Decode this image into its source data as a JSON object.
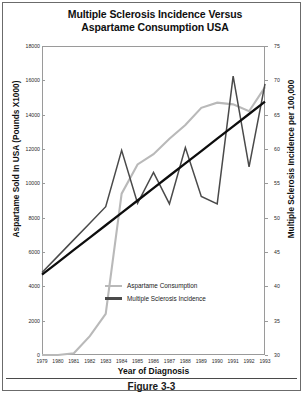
{
  "figure": {
    "title_line1": "Multiple Sclerosis Incidence Versus",
    "title_line2": "Aspartame Consumption USA",
    "caption": "Figure 3-3"
  },
  "legend": {
    "position": "inside-lower-center",
    "items": [
      {
        "label": "Aspartame Consumption",
        "color": "#b9b9b9"
      },
      {
        "label": "Multiple Sclerosis Incidence",
        "color": "#4a4a4a"
      }
    ]
  },
  "colors": {
    "aspartame": "#b9b9b9",
    "ms_incidence": "#4a4a4a",
    "trendline": "#0d0d0d",
    "frame": "#9a9a9a",
    "text": "#101010"
  },
  "chart_data": {
    "type": "line",
    "title": "Multiple Sclerosis Incidence Versus Aspartame Consumption USA",
    "xlabel": "Year of Diagnosis",
    "ylabel": "Aspartame Sold In USA (Pounds X1000)",
    "y2label": "Multiple Sclerosis Incidence per 100,000",
    "grid": false,
    "x": [
      1979,
      1980,
      1981,
      1982,
      1983,
      1984,
      1985,
      1986,
      1987,
      1988,
      1989,
      1990,
      1991,
      1992,
      1993
    ],
    "xtick_labels": [
      "1979",
      "1980",
      "1981",
      "1982",
      "1983",
      "1984",
      "1985",
      "1986",
      "1987",
      "1988",
      "1989",
      "1990",
      "1991",
      "1992",
      "1993"
    ],
    "ylim": [
      0,
      18000
    ],
    "yticks": [
      0,
      2000,
      4000,
      6000,
      8000,
      10000,
      12000,
      14000,
      16000,
      18000
    ],
    "ytick_labels": [
      "0",
      "2000",
      "4000",
      "6000",
      "8000",
      "10000",
      "12000",
      "14000",
      "16000",
      "18000"
    ],
    "y2lim": [
      30,
      75
    ],
    "y2ticks": [
      30,
      35,
      40,
      45,
      50,
      55,
      60,
      65,
      70,
      75
    ],
    "y2tick_labels": [
      "30",
      "35",
      "40",
      "45",
      "50",
      "55",
      "60",
      "65",
      "70",
      "75"
    ],
    "series": [
      {
        "name": "Aspartame Consumption",
        "axis": "left",
        "color": "#b9b9b9",
        "unit": "Pounds X1000",
        "values": [
          0,
          0,
          100,
          1100,
          2400,
          9400,
          11100,
          11700,
          12600,
          13400,
          14400,
          14700,
          14600,
          14200,
          15600
        ]
      },
      {
        "name": "Multiple Sclerosis Incidence",
        "axis": "right",
        "color": "#4a4a4a",
        "unit": "per 100,000",
        "values": [
          42.0,
          44.4,
          46.8,
          49.2,
          51.6,
          59.8,
          52.1,
          56.6,
          52.0,
          60.2,
          53.1,
          52.0,
          70.6,
          57.4,
          69.5
        ]
      },
      {
        "name": "Trendline",
        "axis": "right",
        "color": "#0d0d0d",
        "style": "straight",
        "values": [
          41.7,
          43.5,
          45.3,
          47.1,
          48.9,
          50.7,
          52.5,
          54.3,
          56.1,
          57.9,
          59.7,
          61.5,
          63.3,
          65.1,
          66.9
        ]
      }
    ]
  }
}
